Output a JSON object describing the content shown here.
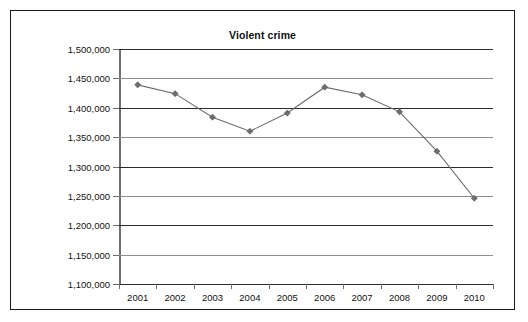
{
  "chart_data": {
    "type": "line",
    "title": "Violent crime",
    "xlabel": "",
    "ylabel": "",
    "categories": [
      "2001",
      "2002",
      "2003",
      "2004",
      "2005",
      "2006",
      "2007",
      "2008",
      "2009",
      "2010"
    ],
    "values": [
      1439000,
      1424000,
      1384000,
      1360000,
      1391000,
      1435000,
      1422000,
      1393000,
      1326000,
      1246000
    ],
    "series": [
      {
        "name": "Violent crime",
        "values": [
          1439000,
          1424000,
          1384000,
          1360000,
          1391000,
          1435000,
          1422000,
          1393000,
          1326000,
          1246000
        ]
      }
    ],
    "ylim": [
      1100000,
      1500000
    ],
    "ytick_step": 50000,
    "ytick_labels": [
      "1,500,000",
      "1,450,000",
      "1,400,000",
      "1,350,000",
      "1,300,000",
      "1,250,000",
      "1,200,000",
      "1,150,000",
      "1,100,000"
    ],
    "ytick_values": [
      1500000,
      1450000,
      1400000,
      1350000,
      1300000,
      1250000,
      1200000,
      1150000,
      1100000
    ],
    "grid": true,
    "legend": "none",
    "marker": "diamond",
    "colors": {
      "line": "#6b6b6b",
      "marker": "#6d6d6d",
      "gridline": "#8d8d8d",
      "gridline_dark": "#2b2b2b",
      "axis": "#6f6f6f",
      "frame": "#1a1a1a",
      "text": "#111111",
      "background": "#ffffff"
    }
  }
}
